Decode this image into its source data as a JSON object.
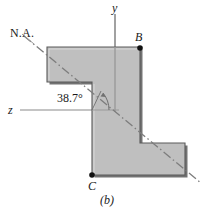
{
  "figure": {
    "caption": "(b)",
    "labels": {
      "neutral_axis": "N.A.",
      "y_axis": "y",
      "z_axis": "z",
      "point_b": "B",
      "point_c": "C",
      "angle": "38.7°"
    },
    "colors": {
      "section_fill": "#bfbfbf",
      "section_edge": "#4d4d4d",
      "section_shadow": "#595959",
      "axis_line": "#8a8a8a",
      "neutral_axis_line": "#8a8a8a",
      "marker": "#111111",
      "text": "#1a1a1a",
      "background": "#ffffff"
    },
    "geometry": {
      "outline": "47,47 140,47 140,143 185,143 185,175 92,175 92,82 47,82",
      "y_axis_line": {
        "x1": 115,
        "y1": 14,
        "x2": 115,
        "y2": 112
      },
      "z_axis_line": {
        "x1": 20,
        "y1": 110,
        "x2": 119,
        "y2": 110
      },
      "na_line": {
        "x1": 24,
        "y1": 36,
        "x2": 201,
        "y2": 183
      },
      "angle_arc": {
        "cx": 82,
        "cy": 83,
        "r": 27
      },
      "marker_b": {
        "cx": 140,
        "cy": 48,
        "r": 2.6
      },
      "marker_c": {
        "cx": 92,
        "cy": 175,
        "r": 2.6
      }
    }
  }
}
